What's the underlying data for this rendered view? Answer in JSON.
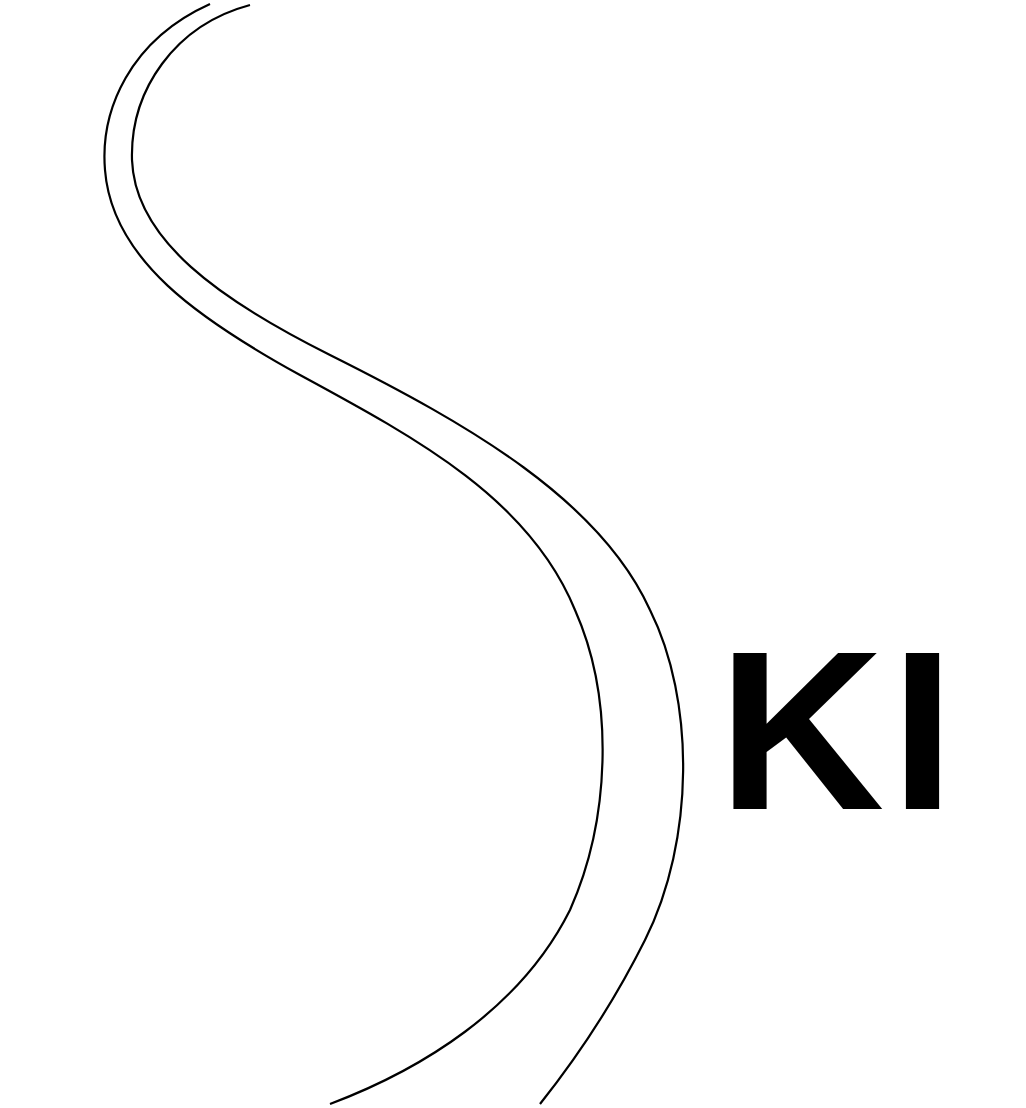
{
  "logo": {
    "text": "KI",
    "description": "S-shaped ski trail formed by two parallel curves with bold lettering",
    "colors": {
      "background": "#ffffff",
      "stroke": "#000000",
      "text": "#000000"
    },
    "curves": [
      {
        "name": "outer-trail-curve"
      },
      {
        "name": "inner-trail-curve"
      }
    ]
  }
}
